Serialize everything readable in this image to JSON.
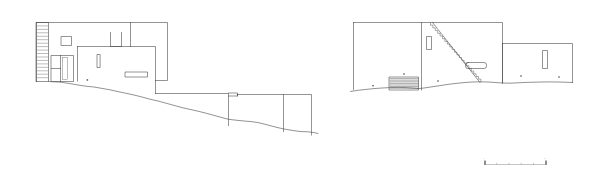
{
  "sheet": {
    "title": "Building Elevations",
    "background_color": "#ffffff",
    "line_color": "#3a3a3a",
    "width_px": 595,
    "height_px": 170,
    "drawing_type": "architectural elevation drawing",
    "notation": "line drawing, no fills"
  },
  "elevations": [
    {
      "id": "left-elevation",
      "name": "West Elevation",
      "description": "Stepped massing descending to the right along a sloping grade line, with slatted screen wall at the left end.",
      "elements": [
        {
          "name": "slatted-screen-wall",
          "type": "hatch",
          "slat_count": 17
        },
        {
          "name": "upper-block",
          "type": "volume"
        },
        {
          "name": "square-window-upper",
          "type": "window"
        },
        {
          "name": "roof-vent-block",
          "type": "volume"
        },
        {
          "name": "main-volume",
          "type": "volume"
        },
        {
          "name": "vertical-slot-window",
          "type": "window"
        },
        {
          "name": "horizontal-strip-window",
          "type": "window"
        },
        {
          "name": "entry-door",
          "type": "door"
        },
        {
          "name": "mid-terrace-volume",
          "type": "volume"
        },
        {
          "name": "lower-terrace-volume",
          "type": "volume"
        },
        {
          "name": "grade-line",
          "type": "ground"
        }
      ]
    },
    {
      "id": "right-elevation",
      "name": "East Elevation",
      "description": "Three stepped bays with an exterior diagonal stair running across the central bay and a terraced step block at the left bay.",
      "elements": [
        {
          "name": "left-bay",
          "type": "volume"
        },
        {
          "name": "terraced-steps",
          "type": "stairs",
          "step_count": 8
        },
        {
          "name": "center-bay",
          "type": "volume"
        },
        {
          "name": "diagonal-stair",
          "type": "stairs",
          "step_count": 22
        },
        {
          "name": "vertical-slot-window-center",
          "type": "window"
        },
        {
          "name": "horizontal-strip-window-center",
          "type": "window"
        },
        {
          "name": "right-bay",
          "type": "volume"
        },
        {
          "name": "vertical-slot-window-right",
          "type": "window"
        },
        {
          "name": "grade-line",
          "type": "ground"
        }
      ]
    }
  ],
  "scale_bar": {
    "name": "graphic-scale-bar",
    "tick_count": 6,
    "start_label": "0",
    "end_label": "5",
    "unit": "m",
    "visible_text": ""
  }
}
